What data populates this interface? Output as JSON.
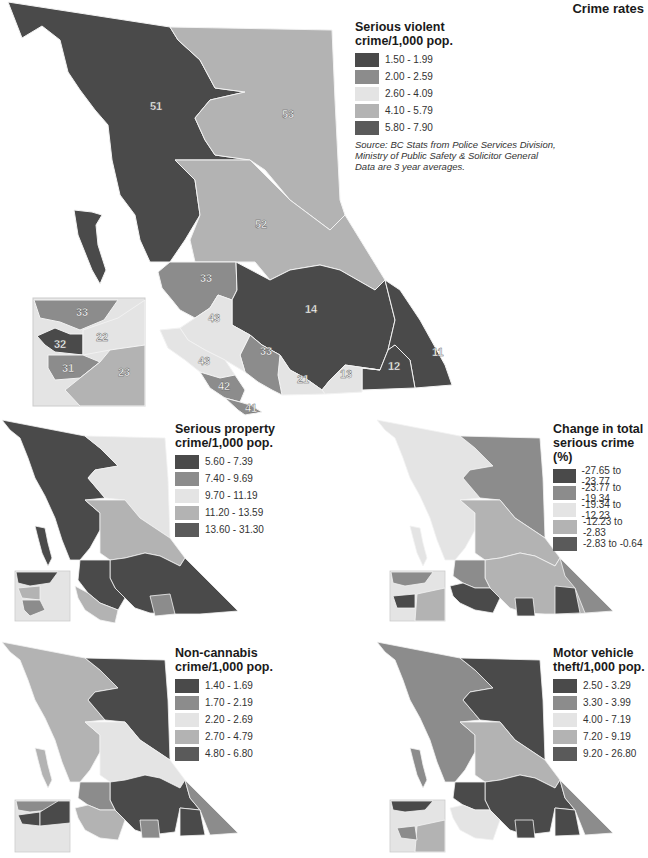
{
  "title": "Crime rates",
  "colors": {
    "c1": "#4a4a4a",
    "c2": "#8c8c8c",
    "c3": "#e4e4e4",
    "c4": "#b3b3b3",
    "c5": "#5a5a5a",
    "border": "#f5f5f5"
  },
  "main_map": {
    "legend": {
      "title_line1": "Serious violent",
      "title_line2": "crime/1,000 pop.",
      "items": [
        {
          "label": "1.50 - 1.99"
        },
        {
          "label": "2.00 - 2.59"
        },
        {
          "label": "2.60 - 4.09"
        },
        {
          "label": "4.10 - 5.79"
        },
        {
          "label": "5.80 - 7.90"
        }
      ],
      "source_line1": "Source: BC Stats from Police Services Division,",
      "source_line2": "Ministry of Public Safety & Solicitor General",
      "source_line3": "Data are 3 year averages."
    },
    "region_labels": {
      "r51": "51",
      "r53": "53",
      "r52": "52",
      "r33a": "33",
      "r14": "14",
      "r43a": "43",
      "r43b": "43",
      "r33b": "33",
      "r42": "42",
      "r41": "41",
      "r21": "21",
      "r13": "13",
      "r12": "12",
      "r11": "11",
      "inset33": "33",
      "inset22": "22",
      "inset32": "32",
      "inset31": "31",
      "inset23": "23"
    }
  },
  "property_map": {
    "legend": {
      "title_line1": "Serious property",
      "title_line2": "crime/1,000 pop.",
      "items": [
        {
          "label": "5.60 - 7.39"
        },
        {
          "label": "7.40 - 9.69"
        },
        {
          "label": "9.70 - 11.19"
        },
        {
          "label": "11.20 - 13.59"
        },
        {
          "label": "13.60 - 31.30"
        }
      ]
    }
  },
  "change_map": {
    "legend": {
      "title_line1": "Change in total",
      "title_line2": "serious crime (%)",
      "items": [
        {
          "label": "-27.65 to -23.77"
        },
        {
          "label": "-23.77 to -19.34"
        },
        {
          "label": "-19.34 to -12.23"
        },
        {
          "label": "-12.23 to -2.83"
        },
        {
          "label": "-2.83 to -0.64"
        }
      ]
    }
  },
  "noncannabis_map": {
    "legend": {
      "title_line1": "Non-cannabis",
      "title_line2": "crime/1,000 pop.",
      "items": [
        {
          "label": "1.40 - 1.69"
        },
        {
          "label": "1.70 - 2.19"
        },
        {
          "label": "2.20 - 2.69"
        },
        {
          "label": "2.70 - 4.79"
        },
        {
          "label": "4.80 - 6.80"
        }
      ]
    }
  },
  "vehicle_map": {
    "legend": {
      "title_line1": "Motor vehicle",
      "title_line2": "theft/1,000 pop.",
      "items": [
        {
          "label": "2.50 - 3.29"
        },
        {
          "label": "3.30 - 3.99"
        },
        {
          "label": "4.00 - 7.19"
        },
        {
          "label": "7.20 - 9.19"
        },
        {
          "label": "9.20 - 26.80"
        }
      ]
    }
  }
}
